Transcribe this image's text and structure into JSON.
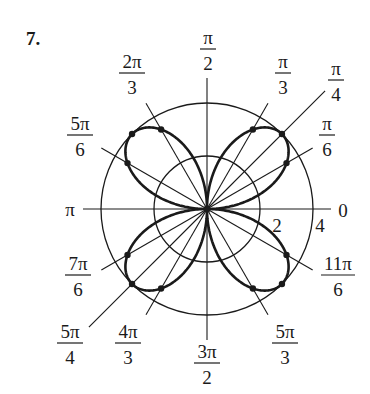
{
  "problem_number": "7.",
  "plot": {
    "equation": "r = 4 sin 2θ",
    "center": [
      207,
      209
    ],
    "scale_px_per_unit": 26.5,
    "circles": [
      2,
      4
    ],
    "radial_labels": [
      {
        "text": "2",
        "x": 277,
        "y": 232
      },
      {
        "text": "4",
        "x": 320,
        "y": 232
      }
    ],
    "curve_color": "#1a1a1a",
    "grid_color": "#1a1a1a",
    "marked_points_theta_deg": [
      30,
      45,
      60,
      120,
      135,
      150,
      210,
      225,
      240,
      300,
      315,
      330
    ]
  },
  "rays": [
    {
      "deg": 0,
      "len": 124
    },
    {
      "deg": 30,
      "len": 122
    },
    {
      "deg": 45,
      "len": 167
    },
    {
      "deg": 60,
      "len": 122
    },
    {
      "deg": 90,
      "len": 131
    },
    {
      "deg": 120,
      "len": 122
    },
    {
      "deg": 150,
      "len": 122
    },
    {
      "deg": 180,
      "len": 124
    },
    {
      "deg": 210,
      "len": 122
    },
    {
      "deg": 225,
      "len": 167
    },
    {
      "deg": 240,
      "len": 122
    },
    {
      "deg": 270,
      "len": 131
    },
    {
      "deg": 300,
      "len": 122
    },
    {
      "deg": 330,
      "len": 122
    }
  ],
  "angle_labels": [
    {
      "name": "pi-over-2",
      "num": "π",
      "den": "2",
      "x": 208,
      "y": 48
    },
    {
      "name": "pi-over-3",
      "num": "π",
      "den": "3",
      "x": 283,
      "y": 72
    },
    {
      "name": "pi-over-4",
      "num": "π",
      "den": "4",
      "x": 336,
      "y": 79
    },
    {
      "name": "pi-over-6",
      "num": "π",
      "den": "6",
      "x": 327,
      "y": 134
    },
    {
      "name": "2pi-over-3",
      "num": "2π",
      "den": "3",
      "x": 132,
      "y": 72
    },
    {
      "name": "5pi-over-6",
      "num": "5π",
      "den": "6",
      "x": 80,
      "y": 134
    },
    {
      "name": "7pi-over-6",
      "num": "7π",
      "den": "6",
      "x": 78,
      "y": 274
    },
    {
      "name": "5pi-over-4",
      "num": "5π",
      "den": "4",
      "x": 70,
      "y": 342
    },
    {
      "name": "4pi-over-3",
      "num": "4π",
      "den": "3",
      "x": 128,
      "y": 342
    },
    {
      "name": "3pi-over-2",
      "num": "3π",
      "den": "2",
      "x": 207,
      "y": 362
    },
    {
      "name": "5pi-over-3",
      "num": "5π",
      "den": "3",
      "x": 285,
      "y": 342
    },
    {
      "name": "11pi-over-6",
      "num": "11π",
      "den": "6",
      "x": 338,
      "y": 274
    }
  ],
  "axis_labels": [
    {
      "name": "pi",
      "text": "π",
      "x": 70,
      "y": 216
    },
    {
      "name": "zero",
      "text": "0",
      "x": 343,
      "y": 217
    }
  ]
}
